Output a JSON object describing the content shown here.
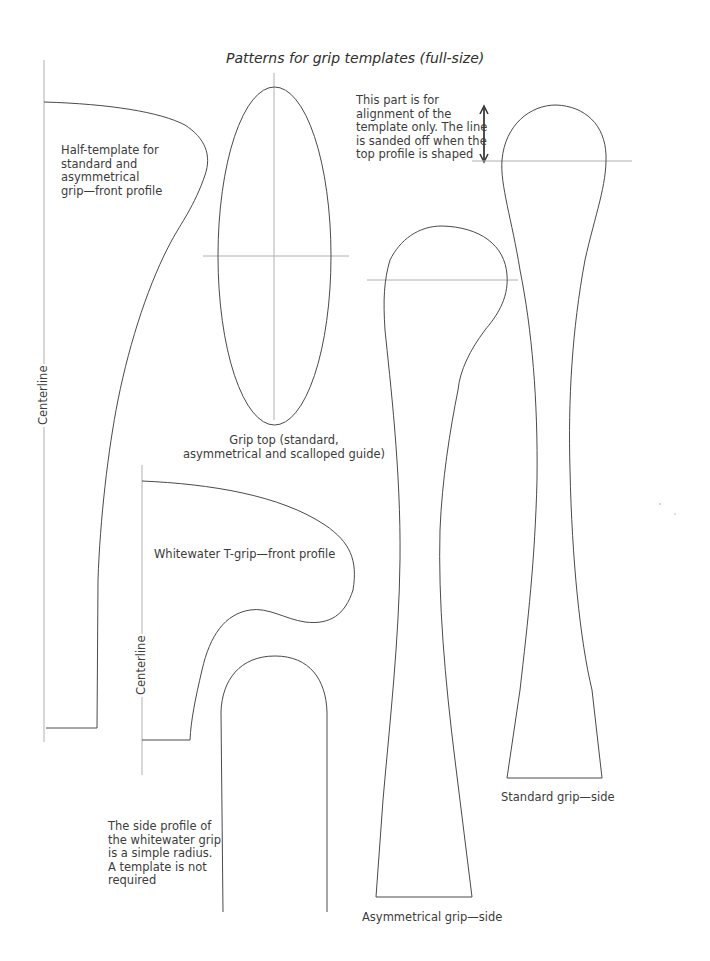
{
  "page": {
    "title": "Patterns for grip templates (full-size)"
  },
  "labels": {
    "half_template": "Half-template for\nstandard and\nasymmetrical\ngrip—front profile",
    "alignment_note": "This part is for\nalignment of the\ntemplate only. The line\nis sanded off when the\ntop profile is shaped",
    "grip_top": "Grip top (standard,\nasymmetrical and scalloped guide)",
    "whitewater_front": "Whitewater T-grip—front profile",
    "whitewater_side_note": "The side profile of\nthe whitewater grip\nis a simple radius.\nA template is not\nrequired",
    "standard_side": "Standard grip—side",
    "asymmetrical_side": "Asymmetrical grip—side",
    "centerline_1": "Centerline",
    "centerline_2": "Centerline"
  },
  "colors": {
    "outline": "#4a4a4a",
    "guide": "#b0b0b0",
    "text": "#3c3c3c"
  }
}
